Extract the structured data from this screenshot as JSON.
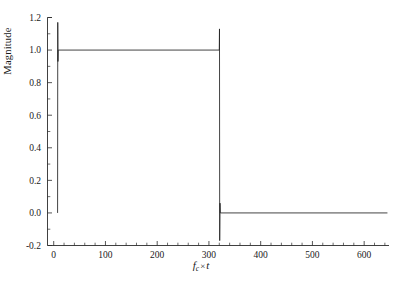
{
  "chart_data": {
    "type": "line",
    "title": "",
    "xlabel": "fc x t",
    "xlabel_base": "f",
    "xlabel_sub": "c",
    "xlabel_times": "×",
    "xlabel_var": "t",
    "ylabel": "Magnitude",
    "xlim": [
      -12,
      648
    ],
    "ylim": [
      -0.2,
      1.2
    ],
    "xticks": [
      0,
      100,
      200,
      300,
      400,
      500,
      600
    ],
    "xticklabels": [
      "0",
      "100",
      "200",
      "300",
      "400",
      "500",
      "600"
    ],
    "xminor_step": 20,
    "yticks": [
      -0.2,
      0.0,
      0.2,
      0.4,
      0.6,
      0.8,
      1.0,
      1.2
    ],
    "yticklabels": [
      "-0.2",
      "0.0",
      "0.2",
      "0.4",
      "0.6",
      "0.8",
      "1.0",
      "1.2"
    ],
    "yminor_step": 0.1,
    "grid": false,
    "legend": null,
    "series": [
      {
        "name": "rectangular-pulse-magnitude",
        "color": "#222222",
        "points": [
          [
            7.5,
            0.0
          ],
          [
            7.8,
            1.17
          ],
          [
            8.2,
            0.93
          ],
          [
            8.6,
            1.0
          ],
          [
            320.0,
            1.0
          ],
          [
            320.4,
            1.13
          ],
          [
            320.8,
            -0.17
          ],
          [
            321.4,
            0.06
          ],
          [
            322.0,
            0.0
          ],
          [
            645.0,
            0.0
          ]
        ]
      }
    ],
    "annotations": []
  },
  "figure": {
    "background_color": "#ffffff",
    "axis_color": "#2b2b2b",
    "line_color": "#222222"
  }
}
